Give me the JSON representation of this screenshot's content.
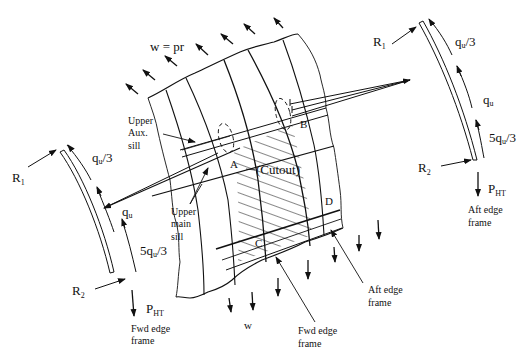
{
  "diagram": {
    "load_label": "w = pr",
    "bottom_load_label": "w",
    "points": {
      "A": "A",
      "B": "B",
      "C": "C",
      "D": "D"
    },
    "cutout_label": "(Cutout)",
    "labels": {
      "upper_aux_sill": [
        "Upper",
        "Aux.",
        "sill"
      ],
      "upper_main_sill": [
        "Upper",
        "main",
        "sill"
      ],
      "fwd_edge_frame_center": [
        "Fwd edge",
        "frame"
      ],
      "aft_edge_frame_center": [
        "Aft edge",
        "frame"
      ]
    },
    "left_frame": {
      "r1": "R",
      "r1_sub": "1",
      "r2": "R",
      "r2_sub": "2",
      "q_top": "q",
      "q_top_sub": "u",
      "q_top_suffix": "/3",
      "q_mid": "q",
      "q_mid_sub": "u",
      "q_bot_prefix": "5q",
      "q_bot_sub": "u",
      "q_bot_suffix": "/3",
      "p": "P",
      "p_sub": "HT",
      "caption": [
        "Fwd edge",
        "frame"
      ]
    },
    "right_frame": {
      "r1": "R",
      "r1_sub": "1",
      "r2": "R",
      "r2_sub": "2",
      "q_top": "q",
      "q_top_sub": "u",
      "q_top_suffix": "/3",
      "q_mid": "q",
      "q_mid_sub": "u",
      "q_bot_prefix": "5q",
      "q_bot_sub": "u",
      "q_bot_suffix": "/3",
      "p": "P",
      "p_sub": "HT",
      "caption": [
        "Aft edge",
        "frame"
      ]
    },
    "colors": {
      "ink": "#111111",
      "background": "#ffffff"
    }
  }
}
